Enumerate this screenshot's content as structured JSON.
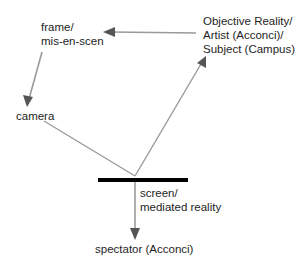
{
  "diagram": {
    "nodes": {
      "frame": {
        "line1": "frame/",
        "line2": "mis-en-scen"
      },
      "objective": {
        "line1": "Objective Reality/",
        "line2": "Artist (Acconci)/",
        "line3": "Subject (Campus)"
      },
      "camera": {
        "label": "camera"
      },
      "screen": {
        "line1": "screen/",
        "line2": "mediated reality"
      },
      "spectator": {
        "label": "spectator (Acconci)"
      }
    },
    "edges": [
      {
        "from": "objective",
        "to": "frame"
      },
      {
        "from": "frame",
        "to": "camera"
      },
      {
        "from": "camera",
        "to": "screen"
      },
      {
        "from": "screen",
        "to": "objective"
      },
      {
        "from": "screen",
        "to": "spectator"
      }
    ],
    "colors": {
      "arrow": "#9a9a9a",
      "arrowhead": "#555555",
      "screen_bar": "#000000",
      "text": "#1e1e1e"
    }
  }
}
